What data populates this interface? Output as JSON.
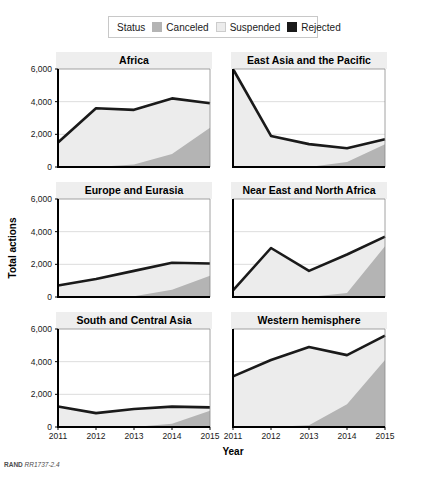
{
  "legend": {
    "title": "Status",
    "items": [
      {
        "label": "Canceled",
        "color": "#b4b4b4"
      },
      {
        "label": "Suspended",
        "color": "#ececec"
      },
      {
        "label": "Rejected",
        "color": "#1a1a1a"
      }
    ]
  },
  "axes": {
    "ylabel": "Total actions",
    "xlabel": "Year",
    "yticks": [
      "0",
      "2,000",
      "4,000",
      "6,000"
    ],
    "xticks": [
      "2011",
      "2012",
      "2013",
      "2014",
      "2015"
    ]
  },
  "credit": {
    "org": "RAND",
    "id": "RR1737-2.4"
  },
  "chart_data": {
    "type": "area",
    "title": "",
    "xlabel": "Year",
    "ylabel": "Total actions",
    "ylim": [
      0,
      6000
    ],
    "grid": true,
    "legend_position": "top",
    "x": [
      2011,
      2012,
      2013,
      2014,
      2015
    ],
    "series_names": [
      "Canceled",
      "Suspended",
      "Rejected"
    ],
    "panels": [
      {
        "title": "Africa",
        "series": [
          {
            "name": "Canceled",
            "values": [
              0,
              0,
              150,
              800,
              2400
            ]
          },
          {
            "name": "Suspended",
            "values": [
              1500,
              3600,
              3500,
              4200,
              3900
            ]
          },
          {
            "name": "Rejected",
            "values": [
              1500,
              3600,
              3500,
              4200,
              3900
            ]
          }
        ]
      },
      {
        "title": "East Asia and the Pacific",
        "series": [
          {
            "name": "Canceled",
            "values": [
              0,
              0,
              0,
              300,
              1400
            ]
          },
          {
            "name": "Suspended",
            "values": [
              6300,
              1900,
              1400,
              1150,
              1700
            ]
          },
          {
            "name": "Rejected",
            "values": [
              6300,
              1900,
              1400,
              1150,
              1700
            ]
          }
        ]
      },
      {
        "title": "Europe and Eurasia",
        "series": [
          {
            "name": "Canceled",
            "values": [
              0,
              0,
              50,
              450,
              1300
            ]
          },
          {
            "name": "Suspended",
            "values": [
              700,
              1100,
              1600,
              2100,
              2050
            ]
          },
          {
            "name": "Rejected",
            "values": [
              700,
              1100,
              1600,
              2100,
              2050
            ]
          }
        ]
      },
      {
        "title": "Near East and North Africa",
        "series": [
          {
            "name": "Canceled",
            "values": [
              0,
              0,
              0,
              250,
              3100
            ]
          },
          {
            "name": "Suspended",
            "values": [
              400,
              3000,
              1600,
              2600,
              3700
            ]
          },
          {
            "name": "Rejected",
            "values": [
              400,
              3000,
              1600,
              2600,
              3700
            ]
          }
        ]
      },
      {
        "title": "South and Central Asia",
        "series": [
          {
            "name": "Canceled",
            "values": [
              0,
              0,
              0,
              200,
              1000
            ]
          },
          {
            "name": "Suspended",
            "values": [
              1250,
              850,
              1100,
              1250,
              1200
            ]
          },
          {
            "name": "Rejected",
            "values": [
              1250,
              850,
              1100,
              1250,
              1200
            ]
          }
        ]
      },
      {
        "title": "Western hemisphere",
        "series": [
          {
            "name": "Canceled",
            "values": [
              0,
              0,
              100,
              1400,
              4100
            ]
          },
          {
            "name": "Suspended",
            "values": [
              3100,
              4100,
              4900,
              4400,
              5600
            ]
          },
          {
            "name": "Rejected",
            "values": [
              3100,
              4100,
              4900,
              4400,
              5600
            ]
          }
        ]
      }
    ]
  }
}
